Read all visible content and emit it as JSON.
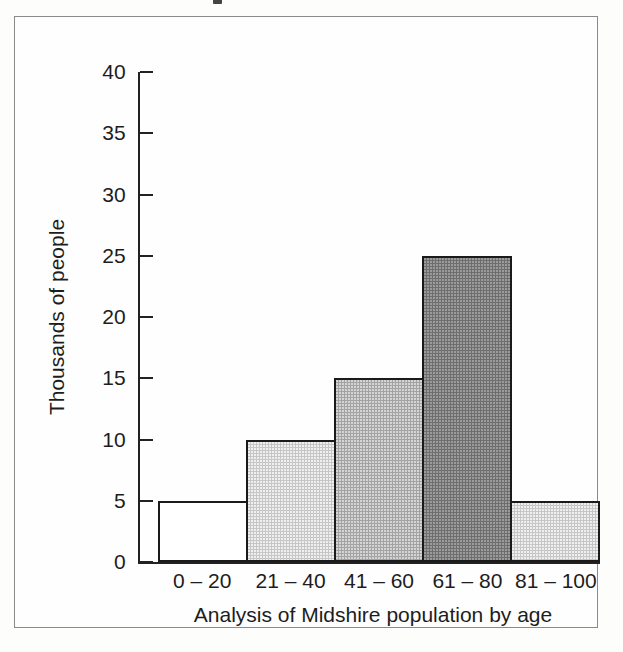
{
  "figure": {
    "frame_border_color": "#8a8a8a",
    "background_color": "#fdfdfc"
  },
  "chart_data": {
    "type": "bar",
    "title": "",
    "xlabel": "Analysis of Midshire population by age",
    "ylabel": "Thousands of people",
    "categories": [
      "0 – 20",
      "21 – 40",
      "41 – 60",
      "61 – 80",
      "81 – 100"
    ],
    "values": [
      5,
      10,
      15,
      25,
      5
    ],
    "ylim": [
      0,
      40
    ],
    "ytick_values": [
      40,
      35,
      30,
      25,
      20,
      15,
      10,
      5,
      0
    ],
    "ytick_labels": [
      "40",
      "35",
      "30",
      "25",
      "20",
      "15",
      "10",
      "5",
      "0"
    ],
    "grid": false,
    "legend": "none",
    "bar_gap": "none",
    "bar_fills": [
      "white",
      "light-gray",
      "medium-gray",
      "dark-gray",
      "light-gray"
    ],
    "bar_fill_colors": [
      "#ffffff",
      "#c6c6c6",
      "#a3a3a3",
      "#6e6e6e",
      "#c6c6c6"
    ],
    "bar_outline_color": "#1a1a1a",
    "axis_color": "#222222",
    "series": [
      {
        "name": "Thousands of people",
        "values": [
          5,
          10,
          15,
          25,
          5
        ]
      }
    ],
    "annotations": []
  }
}
